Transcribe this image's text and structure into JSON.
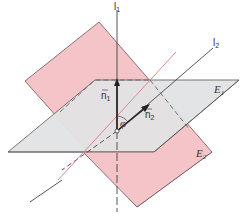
{
  "figure": {
    "colors": {
      "plane_e2_fill": "#f5c4c9",
      "plane_e1_fill": "#e2e3e4",
      "outline": "#555555",
      "red_line": "#e07a82",
      "axis": "#444444"
    },
    "labels": {
      "l1": "l",
      "l1_sub": "1",
      "l2": "l",
      "l2_sub": "2",
      "n1": "n",
      "n1_sub": "1",
      "n2": "n",
      "n2_sub": "2",
      "angle": "φ",
      "e1": "E",
      "e1_sub": "1",
      "e2": "E",
      "e2_sub": "2"
    }
  }
}
